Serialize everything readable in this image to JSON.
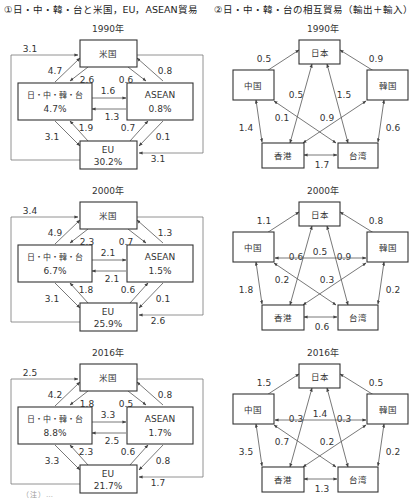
{
  "left_heading": "①日・中・韓・台と米国，EU，ASEAN貿易",
  "right_heading": "②日・中・韓・台の相互貿易（輸出＋輸入）",
  "footnote": "（注）…",
  "chart_data": [
    {
      "type": "diagram",
      "title": "①日・中・韓・台と米国，EU，ASEAN貿易",
      "nodes": [
        "米国",
        "日・中・韓・台",
        "ASEAN",
        "EU"
      ],
      "panels": [
        {
          "year": "1990年",
          "shares": {
            "日・中・韓・台": "4.7%",
            "ASEAN": "0.8%",
            "EU": "30.2%"
          },
          "flows": {
            "EU_to_米国_outer_left": "3.1",
            "日中韓台_to_米国": "4.7",
            "米国_to_日中韓台": "2.6",
            "米国_to_ASEAN": "0.6",
            "ASEAN_to_米国": "0.8",
            "日中韓台_to_ASEAN": "1.6",
            "ASEAN_to_日中韓台": "1.3",
            "日中韓台_to_EU": "3.1",
            "EU_to_日中韓台": "1.9",
            "EU_to_ASEAN": "0.7",
            "ASEAN_to_EU": "0.1",
            "米国_to_EU_outer_right": "3.1"
          }
        },
        {
          "year": "2000年",
          "shares": {
            "日・中・韓・台": "6.7%",
            "ASEAN": "1.5%",
            "EU": "25.9%"
          },
          "flows": {
            "EU_to_米国_outer_left": "3.4",
            "日中韓台_to_米国": "4.9",
            "米国_to_日中韓台": "2.3",
            "米国_to_ASEAN": "0.7",
            "ASEAN_to_米国": "1.3",
            "日中韓台_to_ASEAN": "2.1",
            "ASEAN_to_日中韓台": "2.1",
            "日中韓台_to_EU": "3.1",
            "EU_to_日中韓台": "1.8",
            "EU_to_ASEAN": "0.6",
            "ASEAN_to_EU": "0.1",
            "米国_to_EU_outer_right": "2.6"
          }
        },
        {
          "year": "2016年",
          "shares": {
            "日・中・韓・台": "8.8%",
            "ASEAN": "1.7%",
            "EU": "21.7%"
          },
          "flows": {
            "EU_to_米国_outer_left": "2.5",
            "日中韓台_to_米国": "4.2",
            "米国_to_日中韓台": "1.8",
            "米国_to_ASEAN": "0.5",
            "ASEAN_to_米国": "0.8",
            "日中韓台_to_ASEAN": "3.3",
            "ASEAN_to_日中韓台": "2.5",
            "日中韓台_to_EU": "3.3",
            "EU_to_日中韓台": "2.3",
            "EU_to_ASEAN": "0.6",
            "ASEAN_to_EU": "0.8",
            "米国_to_EU_outer_right": "1.7"
          }
        }
      ]
    },
    {
      "type": "diagram",
      "title": "②日・中・韓・台の相互貿易（輸出＋輸入）",
      "nodes": [
        "日本",
        "中国",
        "韓国",
        "香港",
        "台湾"
      ],
      "panels": [
        {
          "year": "1990年",
          "links": {
            "日本-中国": "0.5",
            "日本-韓国": "0.9",
            "日本-香港": "0.5",
            "日本-台湾": "1.5",
            "中国-台湾": "0.1",
            "韓国-香港": "0.9",
            "中国-香港": "1.4",
            "韓国-台湾": "0.6",
            "香港-台湾": "1.7"
          }
        },
        {
          "year": "2000年",
          "links": {
            "日本-中国": "1.1",
            "日本-韓国": "0.8",
            "日本-香港": "0.6",
            "日本-台湾": "0.9",
            "中国-韓国": "0.5",
            "中国-台湾": "0.2",
            "韓国-香港": "0.3",
            "中国-香港": "1.8",
            "韓国-台湾": "0.2",
            "香港-台湾": "0.6"
          }
        },
        {
          "year": "2016年",
          "links": {
            "日本-中国": "1.5",
            "日本-韓国": "0.5",
            "日本-香港": "0.3",
            "日本-台湾": "0.3",
            "中国-韓国": "1.4",
            "中国-台湾": "0.7",
            "韓国-香港": "0.2",
            "中国-香港": "3.5",
            "韓国-台湾": "0.2",
            "香港-台湾": "1.3"
          }
        }
      ]
    }
  ]
}
